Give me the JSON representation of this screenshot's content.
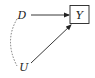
{
  "diagram": {
    "type": "causal-dag",
    "nodes": [
      {
        "id": "D",
        "label": "D",
        "boxed": false
      },
      {
        "id": "Y",
        "label": "Y",
        "boxed": true
      },
      {
        "id": "U",
        "label": "U",
        "boxed": false
      }
    ],
    "edges": [
      {
        "from": "D",
        "to": "Y",
        "style": "solid",
        "directed": true
      },
      {
        "from": "U",
        "to": "Y",
        "style": "solid",
        "directed": true
      },
      {
        "from": "D",
        "to": "U",
        "style": "dashed-curved",
        "directed": false
      }
    ],
    "colors": {
      "ink": "#222222",
      "dashed": "#555555",
      "background": "#ffffff"
    }
  }
}
